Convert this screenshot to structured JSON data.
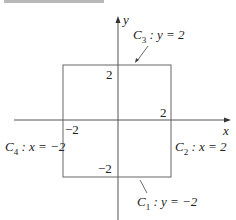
{
  "diagram": {
    "axes": {
      "x_label": "x",
      "y_label": "y"
    },
    "ticks": {
      "y_top": "2",
      "x_right": "2",
      "x_left": "−2",
      "y_bottom": "−2"
    },
    "curves": [
      {
        "name": "C",
        "sub": "3",
        "eq": " : y = 2"
      },
      {
        "name": "C",
        "sub": "2",
        "eq": " : x = 2"
      },
      {
        "name": "C",
        "sub": "4",
        "eq": " : x = −2"
      },
      {
        "name": "C",
        "sub": "1",
        "eq": " : y = −2"
      }
    ],
    "colors": {
      "line": "#555555",
      "text": "#222222"
    }
  }
}
